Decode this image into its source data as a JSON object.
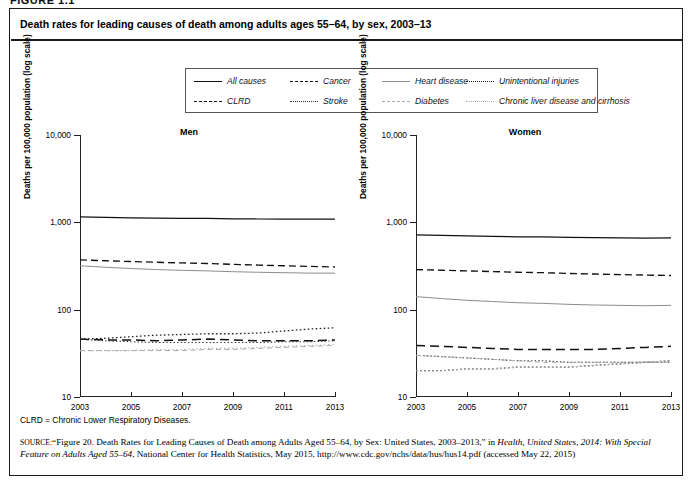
{
  "figure_number": "FIGURE 1.1",
  "figure_title": "Death rates for leading causes of death among adults ages 55–64, by sex, 2003–13",
  "legend": {
    "items": [
      {
        "label": "All causes",
        "style": "ls-solid",
        "row": 1,
        "col": 1
      },
      {
        "label": "Cancer",
        "style": "ls-dash",
        "row": 1,
        "col": 2
      },
      {
        "label": "Heart disease",
        "style": "ls-thin-solid",
        "row": 1,
        "col": 3
      },
      {
        "label": "Unintentional injuries",
        "style": "ls-fine-dot",
        "row": 1,
        "col": 4
      },
      {
        "label": "CLRD",
        "style": "ls-longdash",
        "row": 2,
        "col": 1
      },
      {
        "label": "Stroke",
        "style": "ls-dot",
        "row": 2,
        "col": 2
      },
      {
        "label": "Diabetes",
        "style": "ls-light-dash",
        "row": 2,
        "col": 3
      },
      {
        "label": "Chronic liver disease and cirrhosis",
        "style": "ls-light-dot",
        "row": 2,
        "col": 4
      }
    ]
  },
  "footnote": "CLRD = Chronic Lower Respiratory Diseases.",
  "source": {
    "label": "SOURCE:",
    "text_1": "“Figure 20. Death Rates for Leading Causes of Death among Adults Aged 55–64, by Sex: United States, 2003–2013,” in ",
    "italic_1": "Health, United States, 2014: With Special Feature on Adults Aged 55–64",
    "text_2": ", National Center for Health Statistics, May 2015, http://www.cdc.gov/nchs/data/hus/hus14.pdf (accessed May 22, 2015)"
  },
  "chart_data": [
    {
      "type": "line",
      "title": "Men",
      "xlabel": "",
      "ylabel": "Deaths per 100,000 population (log scale)",
      "yscale": "log",
      "ylim": [
        10,
        10000
      ],
      "yticks": [
        10,
        100,
        1000,
        10000
      ],
      "ytick_labels": [
        "10",
        "100",
        "1,000",
        "10,000"
      ],
      "xlim": [
        2003,
        2013
      ],
      "x": [
        2003,
        2004,
        2005,
        2006,
        2007,
        2008,
        2009,
        2010,
        2011,
        2012,
        2013
      ],
      "xticks": [
        2003,
        2005,
        2007,
        2009,
        2011,
        2013
      ],
      "xtick_labels": [
        "2003",
        "2005",
        "2007",
        "2009",
        "2011",
        "2013"
      ],
      "grid": false,
      "legend_position": "above-figure",
      "series": [
        {
          "name": "All causes",
          "style": "ls-solid",
          "values": [
            1155,
            1140,
            1128,
            1115,
            1108,
            1110,
            1098,
            1092,
            1090,
            1088,
            1090
          ]
        },
        {
          "name": "Cancer",
          "style": "ls-dash",
          "values": [
            372,
            363,
            356,
            349,
            343,
            338,
            330,
            324,
            318,
            313,
            308
          ]
        },
        {
          "name": "Heart disease",
          "style": "ls-thin-solid",
          "values": [
            318,
            306,
            296,
            288,
            282,
            278,
            272,
            268,
            265,
            262,
            262
          ]
        },
        {
          "name": "Unintentional injuries",
          "style": "ls-fine-dot",
          "values": [
            46,
            47,
            49,
            51,
            52,
            53,
            53,
            54,
            57,
            60,
            62
          ]
        },
        {
          "name": "CLRD",
          "style": "ls-longdash",
          "values": [
            46,
            45,
            45,
            44,
            45,
            46,
            45,
            44,
            44,
            44,
            45
          ]
        },
        {
          "name": "Stroke",
          "style": "ls-dot",
          "values": [
            46,
            44,
            43,
            42,
            42,
            42,
            42,
            42,
            43,
            43,
            44
          ]
        },
        {
          "name": "Diabetes",
          "style": "ls-light-dash",
          "values": [
            34,
            34,
            34,
            34,
            34,
            35,
            35,
            36,
            37,
            38,
            39
          ]
        },
        {
          "name": "Chronic liver disease and cirrhosis",
          "style": "ls-light-dot",
          "values": [
            34,
            34,
            34,
            35,
            35,
            36,
            36,
            37,
            38,
            39,
            40
          ]
        }
      ]
    },
    {
      "type": "line",
      "title": "Women",
      "xlabel": "",
      "ylabel": "Deaths per 100,000 population (log scale)",
      "yscale": "log",
      "ylim": [
        10,
        10000
      ],
      "yticks": [
        10,
        100,
        1000,
        10000
      ],
      "ytick_labels": [
        "10",
        "100",
        "1,000",
        "10,000"
      ],
      "xlim": [
        2003,
        2013
      ],
      "x": [
        2003,
        2004,
        2005,
        2006,
        2007,
        2008,
        2009,
        2010,
        2011,
        2012,
        2013
      ],
      "xticks": [
        2003,
        2005,
        2007,
        2009,
        2011,
        2013
      ],
      "xtick_labels": [
        "2003",
        "2005",
        "2007",
        "2009",
        "2011",
        "2013"
      ],
      "grid": false,
      "legend_position": "above-figure",
      "series": [
        {
          "name": "All causes",
          "style": "ls-solid",
          "values": [
            720,
            710,
            700,
            690,
            682,
            680,
            672,
            668,
            664,
            660,
            662
          ]
        },
        {
          "name": "Cancer",
          "style": "ls-dash",
          "values": [
            288,
            283,
            278,
            273,
            268,
            265,
            260,
            256,
            252,
            249,
            246
          ]
        },
        {
          "name": "Heart disease",
          "style": "ls-thin-solid",
          "values": [
            141,
            134,
            128,
            124,
            120,
            118,
            115,
            113,
            112,
            111,
            112
          ]
        },
        {
          "name": "CLRD",
          "style": "ls-longdash",
          "values": [
            39,
            38,
            37,
            36,
            35,
            35,
            35,
            35,
            36,
            37,
            38
          ]
        },
        {
          "name": "Stroke",
          "style": "ls-dot",
          "values": [
            30,
            29,
            28,
            27,
            26,
            26,
            25,
            25,
            25,
            25,
            25
          ]
        },
        {
          "name": "Diabetes",
          "style": "ls-light-dash",
          "values": [
            30,
            29,
            28,
            27,
            26,
            25,
            25,
            25,
            25,
            25,
            25
          ]
        },
        {
          "name": "Unintentional injuries",
          "style": "ls-fine-dot",
          "values": [
            20,
            20,
            21,
            21,
            22,
            22,
            22,
            23,
            24,
            25,
            26
          ]
        },
        {
          "name": "Chronic liver disease and cirrhosis",
          "style": "ls-light-dot",
          "values": [
            20,
            20,
            21,
            21,
            22,
            22,
            22,
            23,
            24,
            25,
            26
          ]
        }
      ]
    }
  ]
}
